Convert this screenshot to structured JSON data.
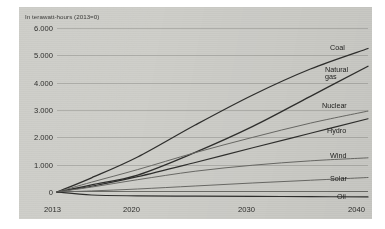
{
  "chart_data": {
    "type": "line",
    "title": "",
    "subtitle": "In terawatt-hours (2013=0)",
    "xlabel": "",
    "ylabel": "",
    "x": [
      2013,
      2020,
      2030,
      2040
    ],
    "xlim": [
      2013,
      2040
    ],
    "ylim": [
      0,
      6000
    ],
    "xticks": [
      "2013",
      "2020",
      "2030",
      "2040"
    ],
    "yticks": [
      "6.000",
      "5.000",
      "4.000",
      "3.000",
      "2.000",
      "1.000",
      "0"
    ],
    "ytick_values": [
      6000,
      5000,
      4000,
      3000,
      2000,
      1000,
      0
    ],
    "grid": true,
    "legend_position": "right-inline",
    "series": [
      {
        "name": "Coal",
        "color": "#2f2f2d",
        "width": 1.3,
        "x": [
          2013,
          2016,
          2020,
          2025,
          2030,
          2035,
          2040
        ],
        "values": [
          0,
          520,
          1280,
          2450,
          3550,
          4500,
          5250
        ]
      },
      {
        "name": "Natural gas",
        "color": "#2f2f2d",
        "width": 1.3,
        "x": [
          2013,
          2016,
          2020,
          2025,
          2030,
          2035,
          2040
        ],
        "values": [
          0,
          260,
          620,
          1450,
          2400,
          3500,
          4600
        ]
      },
      {
        "name": "Nuclear",
        "color": "#6a6a66",
        "width": 1.0,
        "x": [
          2013,
          2016,
          2020,
          2025,
          2030,
          2035,
          2040
        ],
        "values": [
          0,
          360,
          820,
          1440,
          2000,
          2520,
          2960
        ]
      },
      {
        "name": "Hydro",
        "color": "#2f2f2d",
        "width": 1.2,
        "x": [
          2013,
          2016,
          2020,
          2025,
          2030,
          2035,
          2040
        ],
        "values": [
          0,
          210,
          560,
          1080,
          1620,
          2150,
          2680
        ]
      },
      {
        "name": "Wind",
        "color": "#6a6a66",
        "width": 1.0,
        "x": [
          2013,
          2016,
          2020,
          2025,
          2030,
          2035,
          2040
        ],
        "values": [
          0,
          180,
          450,
          760,
          980,
          1140,
          1250
        ]
      },
      {
        "name": "Solar",
        "color": "#6a6a66",
        "width": 1.0,
        "x": [
          2013,
          2016,
          2020,
          2025,
          2030,
          2035,
          2040
        ],
        "values": [
          0,
          40,
          110,
          220,
          330,
          430,
          530
        ]
      },
      {
        "name": "Oil",
        "color": "#2f2f2d",
        "width": 1.2,
        "x": [
          2013,
          2016,
          2020,
          2025,
          2030,
          2035,
          2040
        ],
        "values": [
          0,
          -110,
          -140,
          -150,
          -160,
          -170,
          -180
        ]
      }
    ],
    "series_labels": [
      {
        "name": "Coal",
        "left": 330,
        "top": 44
      },
      {
        "name": "Natural",
        "left": 325,
        "top": 66
      },
      {
        "name": "gas",
        "left": 325,
        "top": 73
      },
      {
        "name": "Nuclear",
        "left": 322,
        "top": 102
      },
      {
        "name": "Hydro",
        "left": 327,
        "top": 127
      },
      {
        "name": "Wind",
        "left": 330,
        "top": 152
      },
      {
        "name": "Solar",
        "left": 330,
        "top": 175
      },
      {
        "name": "Oil",
        "left": 337,
        "top": 193
      }
    ],
    "colors": {
      "panel_background": "#cfcfca",
      "page_background": "#ffffff",
      "gridline": "#a9a9a4",
      "axis": "#6d6d68",
      "text": "#2e2e2c",
      "line_dark": "#2f2f2d",
      "line_gray": "#6a6a66"
    }
  }
}
